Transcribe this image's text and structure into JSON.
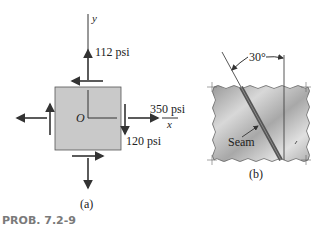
{
  "figure_a": {
    "y_axis_label": "y",
    "x_axis_label": "x",
    "origin_label": "O",
    "stress_y": "112 psi",
    "stress_x": "350 psi",
    "shear": "120 psi",
    "caption": "(a)",
    "element_fill": "#c9c9c9"
  },
  "figure_b": {
    "angle_label": "30°",
    "seam_label": "Seam",
    "caption": "(b)",
    "plate_fill": "#b5b5b5",
    "seam_color": "#555555"
  },
  "problem_label": "PROB. 7.2-9",
  "colors": {
    "ink": "#333333",
    "caption": "#7a7a7a"
  }
}
